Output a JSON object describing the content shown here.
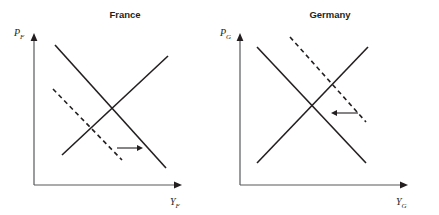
{
  "figure": {
    "type": "diagram",
    "subtype": "aggregate-supply-demand",
    "background_color": "#ffffff",
    "line_color": "#231f20",
    "axis_color": "#58595b",
    "width": 439,
    "height": 215
  },
  "panels": [
    {
      "id": "france",
      "title": "France",
      "title_x": 125,
      "title_y": 18,
      "axes": {
        "origin_x": 34,
        "origin_y": 185,
        "y_top": 33,
        "x_right": 182,
        "y_label_text": "P",
        "y_label_sub": "F",
        "y_label_x": 14,
        "y_label_y": 36,
        "x_label_text": "Y",
        "x_label_sub": "F",
        "x_label_x": 170,
        "x_label_y": 205
      },
      "curves": [
        {
          "name": "supply-curve",
          "style": "solid",
          "direction": "upward-sloping",
          "x1": 62,
          "y1": 155,
          "x2": 168,
          "y2": 56
        },
        {
          "name": "demand-curve-initial",
          "style": "solid",
          "direction": "downward-sloping",
          "x1": 55,
          "y1": 45,
          "x2": 166,
          "y2": 168
        },
        {
          "name": "demand-curve-shifted",
          "style": "dashed",
          "direction": "downward-sloping",
          "x1": 53,
          "y1": 89,
          "x2": 122,
          "y2": 160
        }
      ],
      "shift_arrow": {
        "name": "rightward-shift-arrow",
        "direction": "right",
        "x1": 117,
        "y1": 148,
        "x2": 143,
        "y2": 148
      }
    },
    {
      "id": "germany",
      "title": "Germany",
      "title_x": 330,
      "title_y": 18,
      "axes": {
        "origin_x": 240,
        "origin_y": 185,
        "y_top": 33,
        "x_right": 408,
        "y_label_text": "P",
        "y_label_sub": "G",
        "y_label_x": 220,
        "y_label_y": 36,
        "x_label_text": "Y",
        "x_label_sub": "G",
        "x_label_x": 396,
        "x_label_y": 205
      },
      "curves": [
        {
          "name": "supply-curve",
          "style": "solid",
          "direction": "upward-sloping",
          "x1": 257,
          "y1": 163,
          "x2": 368,
          "y2": 47
        },
        {
          "name": "demand-curve-initial",
          "style": "solid",
          "direction": "downward-sloping",
          "x1": 257,
          "y1": 47,
          "x2": 366,
          "y2": 163
        },
        {
          "name": "demand-curve-shifted",
          "style": "dashed",
          "direction": "downward-sloping",
          "x1": 290,
          "y1": 37,
          "x2": 366,
          "y2": 122
        }
      ],
      "shift_arrow": {
        "name": "leftward-shift-arrow",
        "direction": "left",
        "x1": 358,
        "y1": 113,
        "x2": 331,
        "y2": 113
      }
    }
  ]
}
